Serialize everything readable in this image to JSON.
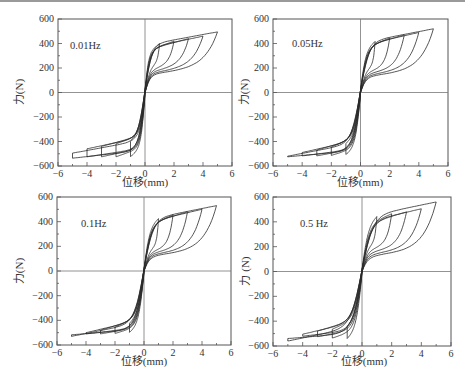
{
  "figure": {
    "caption": ""
  },
  "chart_data": [
    {
      "type": "line",
      "title": "",
      "annotation": "0.01Hz",
      "xlabel": "位移(mm)",
      "ylabel": "力(N)",
      "xlim": [
        -6,
        6
      ],
      "ylim": [
        -600,
        600
      ],
      "xticks": [
        -6,
        -4,
        -2,
        0,
        2,
        4,
        6
      ],
      "yticks": [
        600,
        400,
        200,
        0,
        -200,
        -400,
        -600
      ],
      "grid": false,
      "zero_lines": true,
      "series": [
        {
          "name": "amplitude 1 mm",
          "amplitude_mm": 1,
          "peak_force_N": 400,
          "return_force_N": 150,
          "sharpness": 3.5
        },
        {
          "name": "amplitude 2 mm",
          "amplitude_mm": 2,
          "peak_force_N": 420,
          "return_force_N": 140,
          "sharpness": 3.0
        },
        {
          "name": "amplitude 3 mm",
          "amplitude_mm": 3,
          "peak_force_N": 440,
          "return_force_N": 130,
          "sharpness": 2.6
        },
        {
          "name": "amplitude 4 mm",
          "amplitude_mm": 4,
          "peak_force_N": 460,
          "return_force_N": 120,
          "sharpness": 2.2
        },
        {
          "name": "amplitude 5 mm",
          "amplitude_mm": 5,
          "peak_force_N": 495,
          "return_force_N": 110,
          "sharpness": 2.0
        }
      ]
    },
    {
      "type": "line",
      "title": "",
      "annotation": "0.05Hz",
      "xlabel": "位移(mm)",
      "ylabel": "力(N)",
      "xlim": [
        -6,
        6
      ],
      "ylim": [
        -600,
        600
      ],
      "xticks": [
        -6,
        -4,
        -2,
        0,
        2,
        4,
        6
      ],
      "yticks": [
        600,
        400,
        200,
        0,
        -200,
        -400,
        -600
      ],
      "grid": false,
      "zero_lines": true,
      "series": [
        {
          "name": "amplitude 1 mm",
          "amplitude_mm": 1,
          "peak_force_N": 420,
          "return_force_N": 130,
          "sharpness": 2.6
        },
        {
          "name": "amplitude 2 mm",
          "amplitude_mm": 2,
          "peak_force_N": 445,
          "return_force_N": 120,
          "sharpness": 2.3
        },
        {
          "name": "amplitude 3 mm",
          "amplitude_mm": 3,
          "peak_force_N": 470,
          "return_force_N": 110,
          "sharpness": 2.0
        },
        {
          "name": "amplitude 4 mm",
          "amplitude_mm": 4,
          "peak_force_N": 490,
          "return_force_N": 100,
          "sharpness": 1.8
        },
        {
          "name": "amplitude 5 mm",
          "amplitude_mm": 5,
          "peak_force_N": 520,
          "return_force_N": 90,
          "sharpness": 1.6
        }
      ]
    },
    {
      "type": "line",
      "title": "",
      "annotation": "0.1Hz",
      "xlabel": "位移(mm)",
      "ylabel": "力(N)",
      "xlim": [
        -6,
        6
      ],
      "ylim": [
        -600,
        600
      ],
      "xticks": [
        -6,
        -4,
        -2,
        0,
        2,
        4,
        6
      ],
      "yticks": [
        600,
        400,
        200,
        0,
        -200,
        -400,
        -600
      ],
      "grid": false,
      "zero_lines": true,
      "series": [
        {
          "name": "amplitude 1 mm",
          "amplitude_mm": 1,
          "peak_force_N": 430,
          "return_force_N": 120,
          "sharpness": 2.4
        },
        {
          "name": "amplitude 2 mm",
          "amplitude_mm": 2,
          "peak_force_N": 455,
          "return_force_N": 110,
          "sharpness": 2.1
        },
        {
          "name": "amplitude 3 mm",
          "amplitude_mm": 3,
          "peak_force_N": 480,
          "return_force_N": 100,
          "sharpness": 1.9
        },
        {
          "name": "amplitude 4 mm",
          "amplitude_mm": 4,
          "peak_force_N": 500,
          "return_force_N": 90,
          "sharpness": 1.7
        },
        {
          "name": "amplitude 5 mm",
          "amplitude_mm": 5,
          "peak_force_N": 530,
          "return_force_N": 80,
          "sharpness": 1.5
        }
      ]
    },
    {
      "type": "line",
      "title": "",
      "annotation": "0.5 Hz",
      "xlabel": "位移(mm)",
      "ylabel": "力 (N)",
      "xlim": [
        -6,
        6
      ],
      "ylim": [
        -600,
        600
      ],
      "xticks": [
        -6,
        -4,
        -2,
        0,
        2,
        4,
        6
      ],
      "yticks": [
        600,
        400,
        200,
        0,
        -200,
        -400,
        -600
      ],
      "grid": false,
      "zero_lines": true,
      "series": [
        {
          "name": "amplitude 1 mm",
          "amplitude_mm": 1,
          "peak_force_N": 450,
          "return_force_N": 140,
          "sharpness": 2.2
        },
        {
          "name": "amplitude 2 mm",
          "amplitude_mm": 2,
          "peak_force_N": 465,
          "return_force_N": 125,
          "sharpness": 1.9
        },
        {
          "name": "amplitude 3 mm",
          "amplitude_mm": 3,
          "peak_force_N": 480,
          "return_force_N": 110,
          "sharpness": 1.7
        },
        {
          "name": "amplitude 4 mm",
          "amplitude_mm": 4,
          "peak_force_N": 505,
          "return_force_N": 95,
          "sharpness": 1.5
        },
        {
          "name": "amplitude 5 mm",
          "amplitude_mm": 5,
          "peak_force_N": 560,
          "return_force_N": 80,
          "sharpness": 1.3
        }
      ]
    }
  ],
  "colors": {
    "line": "#2a2a2a",
    "axis": "#555555",
    "text": "#333333"
  }
}
